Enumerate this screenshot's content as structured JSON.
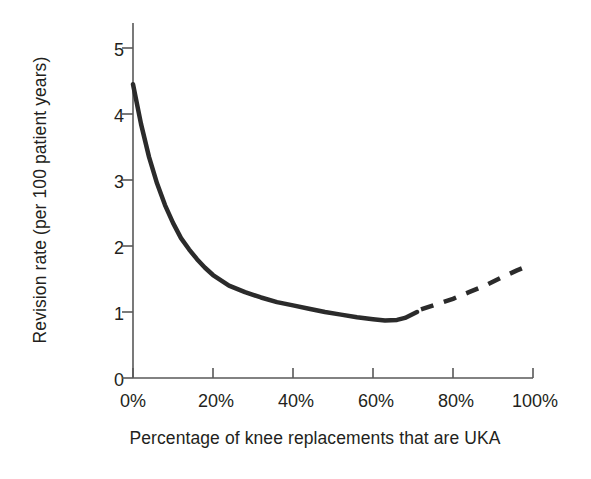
{
  "chart_data": {
    "type": "line",
    "title": "",
    "xlabel": "Percentage of knee replacements that are UKA",
    "ylabel": "Revision rate (per 100 patient years)",
    "xlim": [
      0,
      100
    ],
    "ylim": [
      0,
      5
    ],
    "grid": false,
    "legend": "none",
    "xtick_labels": [
      "0%",
      "20%",
      "40%",
      "60%",
      "80%",
      "100%"
    ],
    "xtick_values": [
      0,
      20,
      40,
      60,
      80,
      100
    ],
    "ytick_labels": [
      "0",
      "1",
      "2",
      "3",
      "4",
      "5"
    ],
    "ytick_values": [
      0,
      1,
      2,
      3,
      4,
      5
    ],
    "line_color": "#2b2b2b",
    "line_width": 4.5,
    "series": [
      {
        "name": "Revision rate (observed)",
        "style": "solid",
        "x": [
          0,
          2,
          4,
          6,
          8,
          10,
          12,
          14,
          16,
          18,
          20,
          24,
          28,
          32,
          36,
          40,
          44,
          48,
          52,
          56,
          60,
          63,
          66,
          68,
          70,
          71
        ],
        "values": [
          4.45,
          3.85,
          3.35,
          2.95,
          2.62,
          2.35,
          2.12,
          1.95,
          1.8,
          1.67,
          1.56,
          1.4,
          1.3,
          1.22,
          1.15,
          1.1,
          1.05,
          1.0,
          0.96,
          0.92,
          0.89,
          0.87,
          0.88,
          0.91,
          0.97,
          1.0
        ]
      },
      {
        "name": "Revision rate (extrapolated)",
        "style": "dashed",
        "x": [
          72,
          76,
          80,
          84,
          88,
          92,
          96,
          98
        ],
        "values": [
          1.04,
          1.12,
          1.2,
          1.3,
          1.4,
          1.52,
          1.63,
          1.68
        ]
      }
    ],
    "annotations": []
  },
  "axis": {
    "y_title": "Revision rate (per 100 patient years)",
    "x_title": "Percentage of knee replacements that are UKA"
  }
}
